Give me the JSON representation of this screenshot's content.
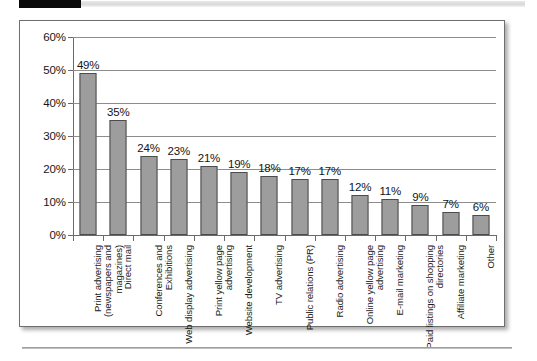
{
  "page": {
    "top_strip": {
      "tab_label": "",
      "rule_label": ""
    },
    "bottom_rule_label": ""
  },
  "chart_data": {
    "type": "bar",
    "title": "",
    "xlabel": "",
    "ylabel": "",
    "ylim": [
      0,
      60
    ],
    "ytick_labels": [
      "0%",
      "10%",
      "20%",
      "30%",
      "40%",
      "50%",
      "60%"
    ],
    "yticks": [
      0,
      10,
      20,
      30,
      40,
      50,
      60
    ],
    "grid": true,
    "legend": "none",
    "bar_color": "#9d9d9d",
    "bar_edge_color": "#4c4c4c",
    "categories": [
      "Print advertising (newspapers and magazines)",
      "Direct mail",
      "Conferences and Exhibitions",
      "Web display advertising",
      "Print yellow page advertising",
      "Website development",
      "TV advertising",
      "Public relations (PR)",
      "Radio advertising",
      "Online yellow page advertising",
      "E-mail marketing",
      "Paid listings on shopping directories",
      "Affiliate marketing",
      "Other"
    ],
    "values": [
      49,
      35,
      24,
      23,
      21,
      19,
      18,
      17,
      17,
      12,
      11,
      9,
      7,
      6
    ],
    "data_labels": [
      "49%",
      "35%",
      "24%",
      "23%",
      "21%",
      "19%",
      "18%",
      "17%",
      "17%",
      "12%",
      "11%",
      "9%",
      "7%",
      "6%"
    ]
  }
}
